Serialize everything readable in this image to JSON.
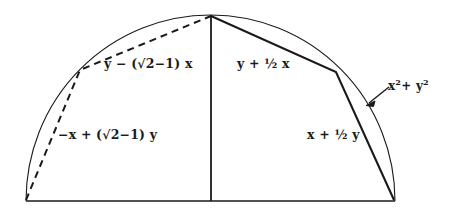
{
  "figure": {
    "background_color": "#ffffff",
    "stroke_color": "#1a1a1a",
    "arc": {
      "description": "semicircular-arc",
      "left_endpoint": [
        26,
        201
      ],
      "apex": [
        211,
        15
      ],
      "right_endpoint": [
        395,
        201
      ]
    },
    "baseline": {
      "from": [
        26,
        201
      ],
      "to": [
        395,
        201
      ]
    },
    "vertical_radius": {
      "from": [
        211,
        15
      ],
      "to": [
        211,
        201
      ]
    },
    "dashed_path": {
      "style": "dashed",
      "points": [
        [
          26,
          200
        ],
        [
          80,
          70
        ],
        [
          211,
          16
        ]
      ]
    },
    "solid_path": {
      "style": "solid",
      "points": [
        [
          211,
          16
        ],
        [
          336,
          72
        ],
        [
          394,
          200
        ]
      ]
    },
    "annotation_arrow": {
      "from": [
        388,
        88
      ],
      "to": [
        367,
        104
      ]
    },
    "labels": {
      "upper_left": "y − (√2−1) x",
      "upper_right": "y + ½ x",
      "lower_left": "−x + (√2−1) y",
      "lower_right": "x + ½ y",
      "circle_equation_base": "x",
      "circle_equation_exp1": "2",
      "circle_equation_mid": "+ y",
      "circle_equation_exp2": "2"
    }
  }
}
